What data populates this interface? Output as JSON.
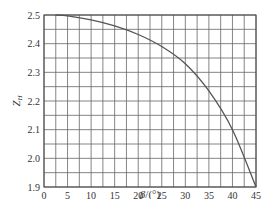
{
  "chart_data": {
    "type": "line",
    "title": "",
    "xlabel": "β/(°)",
    "ylabel": "Z_H",
    "xlim": [
      0,
      45
    ],
    "ylim": [
      1.9,
      2.5
    ],
    "grid": true,
    "grid_x_step": 2.5,
    "grid_y_step": 0.05,
    "x_ticks": [
      0,
      5,
      10,
      15,
      20,
      25,
      30,
      35,
      40,
      45
    ],
    "x_tick_labels": [
      "0",
      "5",
      "10",
      "15",
      "20",
      "25",
      "30",
      "35",
      "40",
      "45"
    ],
    "y_ticks": [
      1.9,
      2.0,
      2.1,
      2.2,
      2.3,
      2.4,
      2.5
    ],
    "y_tick_labels": [
      "1.9",
      "2.0",
      "2.1",
      "2.2",
      "2.3",
      "2.4",
      "2.5"
    ],
    "legend": null,
    "series": [
      {
        "name": "Z_H",
        "color": "#555555",
        "x": [
          2.5,
          5,
          10,
          15,
          20,
          25,
          30,
          35,
          40,
          45
        ],
        "values": [
          2.5,
          2.497,
          2.483,
          2.462,
          2.432,
          2.39,
          2.33,
          2.235,
          2.1,
          1.9
        ]
      }
    ]
  },
  "labels": {
    "xlabel_beta": "β",
    "xlabel_unit": "/(°)",
    "ylabel_main": "Z",
    "ylabel_sub": "H"
  }
}
